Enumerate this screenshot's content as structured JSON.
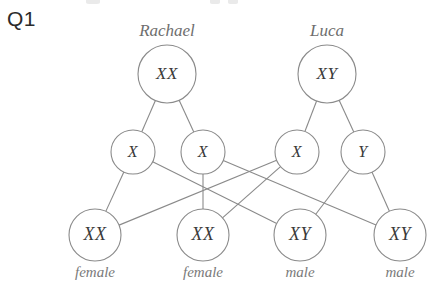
{
  "question": {
    "tag": "Q1"
  },
  "diagram": {
    "title_parents": [
      "Rachael",
      "Luca"
    ],
    "parents": [
      {
        "id": "rachael",
        "name": "Rachael",
        "genotype": "XX",
        "cx": 167,
        "cy": 74,
        "r": 29
      },
      {
        "id": "luca",
        "name": "Luca",
        "genotype": "XY",
        "cx": 327,
        "cy": 74,
        "r": 29
      }
    ],
    "gametes": [
      {
        "id": "g1",
        "allele": "X",
        "parent": "rachael",
        "cx": 133,
        "cy": 152,
        "r": 22
      },
      {
        "id": "g2",
        "allele": "X",
        "parent": "rachael",
        "cx": 203,
        "cy": 152,
        "r": 22
      },
      {
        "id": "g3",
        "allele": "X",
        "parent": "luca",
        "cx": 297,
        "cy": 152,
        "r": 22
      },
      {
        "id": "g4",
        "allele": "Y",
        "parent": "luca",
        "cx": 363,
        "cy": 152,
        "r": 22
      }
    ],
    "offspring": [
      {
        "id": "o1",
        "genotype": "XX",
        "sex": "female",
        "cx": 95,
        "cy": 235,
        "r": 26,
        "label_y": 277
      },
      {
        "id": "o2",
        "genotype": "XX",
        "sex": "female",
        "cx": 203,
        "cy": 235,
        "r": 26,
        "label_y": 277
      },
      {
        "id": "o3",
        "genotype": "XY",
        "sex": "male",
        "cx": 300,
        "cy": 235,
        "r": 26,
        "label_y": 277
      },
      {
        "id": "o4",
        "genotype": "XY",
        "sex": "male",
        "cx": 400,
        "cy": 235,
        "r": 26,
        "label_y": 277
      }
    ],
    "parent_gamete_links": [
      {
        "from": "rachael",
        "to": "g1"
      },
      {
        "from": "rachael",
        "to": "g2"
      },
      {
        "from": "luca",
        "to": "g3"
      },
      {
        "from": "luca",
        "to": "g4"
      }
    ],
    "gamete_offspring_links": [
      {
        "from": "g1",
        "to": "o1"
      },
      {
        "from": "g1",
        "to": "o3"
      },
      {
        "from": "g2",
        "to": "o2"
      },
      {
        "from": "g2",
        "to": "o4"
      },
      {
        "from": "g3",
        "to": "o1"
      },
      {
        "from": "g3",
        "to": "o2"
      },
      {
        "from": "g4",
        "to": "o3"
      },
      {
        "from": "g4",
        "to": "o4"
      }
    ],
    "colors": {
      "stroke": "#8a8a8a",
      "genotype_text": "#3a3a3a",
      "name_text": "#6e6e6e",
      "sex_text": "#7a7a7a",
      "tag_text": "#2b2b2b",
      "background": "#ffffff"
    }
  }
}
